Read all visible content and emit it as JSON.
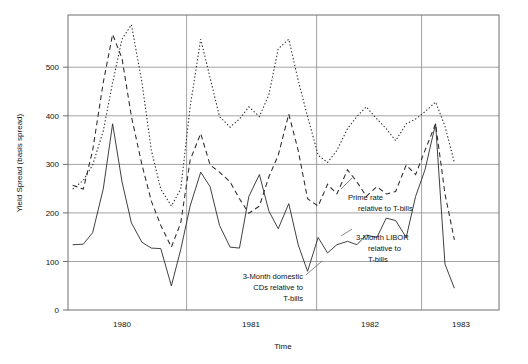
{
  "chart_data": {
    "type": "line",
    "title": "",
    "xlabel": "Time",
    "ylabel": "Yield Spread (basis spread)",
    "xlim": [
      1979.58,
      1983.25
    ],
    "ylim": [
      0,
      610
    ],
    "grid": true,
    "legend_position": "inline-annotations",
    "y_ticks": [
      0,
      100,
      200,
      300,
      400,
      500
    ],
    "y_tick_labels": [
      "0",
      "100",
      "200",
      "300",
      "400",
      "500"
    ],
    "x_ticks": [
      1980,
      1981,
      1982,
      1983
    ],
    "x_tick_labels": [
      "1980",
      "1981",
      "1982",
      "1983"
    ],
    "x_gridlines": [
      1980.5,
      1981.5,
      1982.5
    ],
    "series": [
      {
        "name": "Prime rate relative to T-bills",
        "style": "dotted",
        "annotation": "Prime rate\nrelative to T-bills",
        "x": [
          1979.62,
          1979.71,
          1979.79,
          1979.88,
          1979.96,
          1980.04,
          1980.12,
          1980.21,
          1980.29,
          1980.37,
          1980.46,
          1980.54,
          1980.62,
          1980.71,
          1980.79,
          1980.87,
          1980.96,
          1981.04,
          1981.12,
          1981.21,
          1981.29,
          1981.37,
          1981.46,
          1981.54,
          1981.62,
          1981.71,
          1981.79,
          1981.87,
          1981.96,
          1982.04,
          1982.12,
          1982.21,
          1982.29,
          1982.37,
          1982.46,
          1982.54,
          1982.62,
          1982.71,
          1982.79,
          1982.87
        ],
        "y": [
          250,
          268,
          300,
          370,
          470,
          560,
          590,
          470,
          330,
          250,
          215,
          250,
          420,
          560,
          480,
          400,
          378,
          395,
          420,
          400,
          445,
          540,
          560,
          475,
          400,
          320,
          305,
          330,
          375,
          400,
          420,
          395,
          375,
          350,
          385,
          395,
          410,
          430,
          380,
          305
        ],
        "ylabel_units": "basis points"
      },
      {
        "name": "3-Month LIBOR relative to T-bills",
        "style": "dashed",
        "annotation": "3-Month LIBOR\nrelative to\nT-bills",
        "x": [
          1979.62,
          1979.71,
          1979.79,
          1979.88,
          1979.96,
          1980.04,
          1980.12,
          1980.21,
          1980.29,
          1980.37,
          1980.46,
          1980.54,
          1980.62,
          1980.71,
          1980.79,
          1980.87,
          1980.96,
          1981.04,
          1981.12,
          1981.21,
          1981.29,
          1981.37,
          1981.46,
          1981.54,
          1981.62,
          1981.71,
          1981.79,
          1981.87,
          1981.96,
          1982.04,
          1982.12,
          1982.21,
          1982.29,
          1982.37,
          1982.46,
          1982.54,
          1982.62,
          1982.71,
          1982.79,
          1982.87
        ],
        "y": [
          258,
          250,
          330,
          470,
          570,
          520,
          400,
          300,
          225,
          175,
          130,
          180,
          310,
          365,
          300,
          285,
          265,
          230,
          200,
          215,
          275,
          320,
          405,
          330,
          230,
          215,
          260,
          240,
          290,
          265,
          235,
          255,
          240,
          245,
          300,
          280,
          330,
          385,
          240,
          145
        ],
        "ylabel_units": "basis points"
      },
      {
        "name": "3-Month domestic CDs relative to T-bills",
        "style": "solid",
        "annotation": "3-Month domestic\nCDs relative to\nT-bills",
        "x": [
          1979.62,
          1979.71,
          1979.79,
          1979.88,
          1979.96,
          1980.04,
          1980.12,
          1980.21,
          1980.29,
          1980.37,
          1980.46,
          1980.54,
          1980.62,
          1980.71,
          1980.79,
          1980.87,
          1980.96,
          1981.04,
          1981.12,
          1981.21,
          1981.29,
          1981.37,
          1981.46,
          1981.54,
          1981.62,
          1981.71,
          1981.79,
          1981.87,
          1981.96,
          1982.04,
          1982.12,
          1982.21,
          1982.29,
          1982.37,
          1982.46,
          1982.54,
          1982.62,
          1982.71,
          1982.79,
          1982.87
        ],
        "y": [
          135,
          136,
          160,
          250,
          385,
          265,
          180,
          140,
          128,
          127,
          50,
          125,
          215,
          285,
          255,
          175,
          130,
          128,
          235,
          280,
          205,
          168,
          220,
          135,
          80,
          150,
          118,
          135,
          142,
          135,
          155,
          150,
          190,
          185,
          150,
          235,
          290,
          385,
          95,
          45
        ],
        "ylabel_units": "basis points"
      }
    ]
  },
  "axes": {
    "y_title": "Yield Spread (basis spread)",
    "x_title": "Time",
    "y_tick_labels": [
      "0",
      "100",
      "200",
      "300",
      "400",
      "500"
    ],
    "x_tick_labels": [
      "1980",
      "1981",
      "1982",
      "1983"
    ]
  },
  "annotations": [
    {
      "id": "prime-rate",
      "lines": [
        "Prime rate",
        "relative to T-bills"
      ],
      "anchor": "left"
    },
    {
      "id": "libor",
      "lines": [
        "3-Month LIBOR",
        "relative to",
        "T-bills"
      ],
      "anchor": "left"
    },
    {
      "id": "cds",
      "lines": [
        "3-Month domestic",
        "CDs relative to",
        "T-bills"
      ],
      "anchor": "right"
    }
  ]
}
